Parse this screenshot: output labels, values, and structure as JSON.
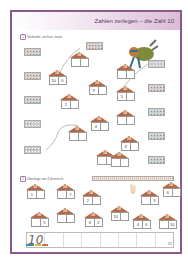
{
  "header": {
    "title": "Zahlen zerlegen – die Zahl 10"
  },
  "task1": {
    "number": "1",
    "instruction": "Verbinde, rechne, male."
  },
  "task2": {
    "number": "2",
    "instruction": "Überlege am Zahnstrich."
  },
  "houses_task1": [
    {
      "roof": "10",
      "left": "",
      "right": ""
    },
    {
      "roof": "10",
      "left": "10",
      "right": "0"
    },
    {
      "roof": "10",
      "left": "",
      "right": ""
    },
    {
      "roof": "10",
      "left": "9",
      "right": ""
    },
    {
      "roof": "10",
      "left": "5",
      "right": ""
    },
    {
      "roof": "10",
      "left": "2",
      "right": ""
    },
    {
      "roof": "10",
      "left": "4",
      "right": ""
    },
    {
      "roof": "10",
      "left": "",
      "right": ""
    },
    {
      "roof": "10",
      "left": "",
      "right": ""
    },
    {
      "roof": "10",
      "left": "",
      "right": ""
    },
    {
      "roof": "10",
      "left": "6",
      "right": ""
    },
    {
      "roof": "10",
      "left": "",
      "right": ""
    }
  ],
  "houses_task2": [
    {
      "roof": "10",
      "left": "1",
      "right": ""
    },
    {
      "roof": "10",
      "left": "",
      "right": "7"
    },
    {
      "roof": "10",
      "left": "2",
      "right": ""
    },
    {
      "roof": "10",
      "left": "",
      "right": "3"
    },
    {
      "roof": "10",
      "left": "6",
      "right": ""
    },
    {
      "roof": "10",
      "left": "",
      "right": "5"
    },
    {
      "roof": "10",
      "left": "",
      "right": ""
    },
    {
      "roof": "10",
      "left": "8",
      "right": "2"
    },
    {
      "roof": "10",
      "left": "10",
      "right": ""
    },
    {
      "roof": "10",
      "left": "4",
      "right": "6"
    },
    {
      "roof": "10",
      "left": "",
      "right": "10"
    }
  ],
  "writing_line": {
    "sample": "10"
  },
  "footer": {
    "page_number": "11"
  },
  "colors": {
    "frame": "#8a5a8c",
    "roof": "#b56a45",
    "red_dot": "#c0603a",
    "blue_dot": "#3c8fb0"
  }
}
